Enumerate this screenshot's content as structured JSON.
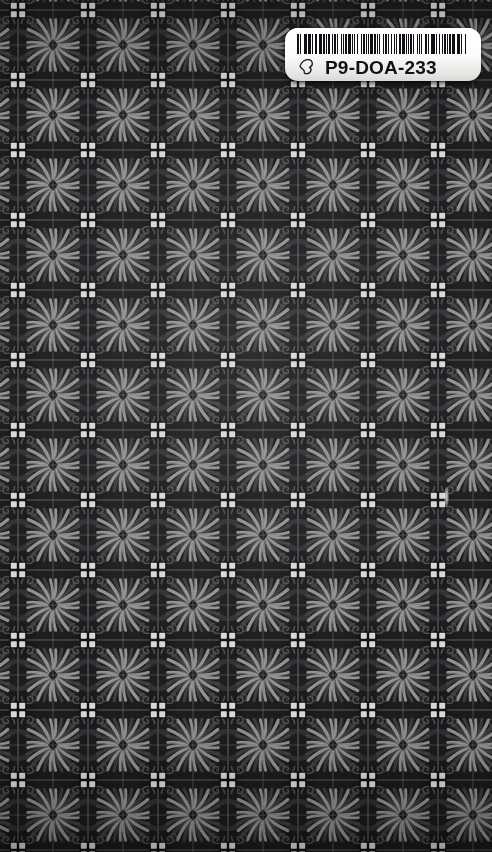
{
  "scene": {
    "width": 492,
    "height": 852,
    "description": "Dark ornamental damask tiled wallpaper with an adhesive barcode inventory label at top right"
  },
  "background": {
    "name": "ornamental-damask-tile",
    "tile_size_px": 70,
    "colors": {
      "base_dark": "#1a1a1d",
      "deep_shadow": "#0d0d10",
      "mid_gray": "#4a4a4d",
      "petal_light": "#9a9a98",
      "highlight": "#c9c9c6",
      "dot_white": "#d8d8d5",
      "seam_line": "#6e6e6c"
    },
    "motifs": [
      "four-dot-square-center",
      "corner-scrollwork",
      "radiating-petal-fan",
      "lattice-seam-grid",
      "center-diamond"
    ]
  },
  "label": {
    "name": "barcode-label",
    "code": "P9-DOA-233",
    "icon": "cursor-mark-icon",
    "background_color": "#ffffff",
    "text_color": "#121216",
    "barcode": {
      "symbology": "code-128",
      "bars": [
        2,
        1,
        1,
        3,
        1,
        1,
        2,
        1,
        3,
        1,
        1,
        2,
        1,
        1,
        1,
        2,
        3,
        1,
        2,
        1,
        1,
        1,
        3,
        2,
        1,
        1,
        2,
        1,
        1,
        3,
        1,
        2,
        1,
        1,
        2,
        1,
        3,
        1,
        1,
        1,
        2,
        2,
        1,
        3,
        1,
        1,
        2,
        1,
        1,
        2,
        1,
        1,
        3,
        1,
        2,
        1,
        1,
        1,
        2,
        3,
        1,
        1,
        2,
        1,
        1,
        2,
        1,
        3,
        1,
        1,
        1,
        2,
        2,
        1,
        3,
        1,
        1,
        2,
        1,
        1,
        2,
        1,
        1,
        3,
        1,
        2,
        1,
        1,
        1,
        3,
        2,
        1,
        1,
        2,
        1,
        1,
        3,
        1,
        1,
        2,
        1,
        2,
        1,
        1,
        3,
        1,
        1,
        1,
        2,
        1,
        3,
        2,
        1,
        1,
        2,
        1,
        1,
        3,
        1,
        2
      ]
    }
  }
}
